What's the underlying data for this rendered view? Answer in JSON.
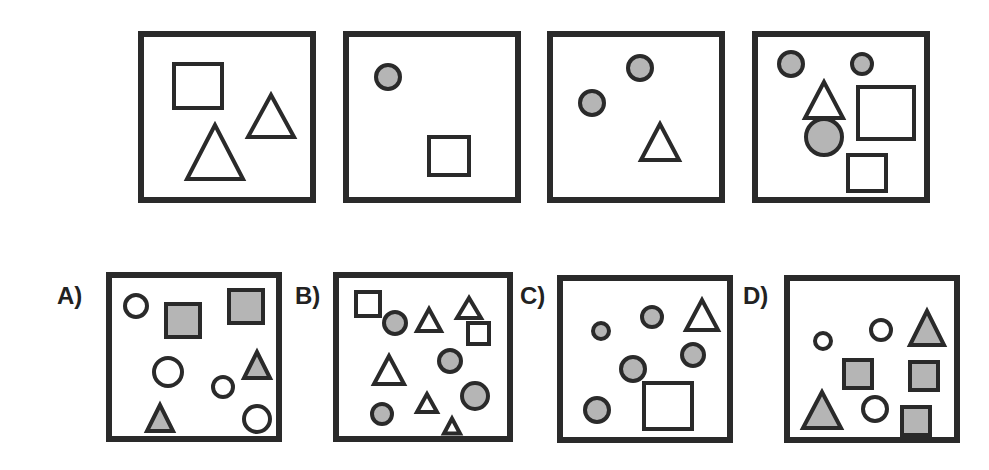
{
  "puzzle": {
    "colors": {
      "stroke": "#2a2a2a",
      "fill_gray": "#b5b5b5",
      "fill_white": "#ffffff"
    },
    "question_panels": [
      {
        "id": "q1",
        "box": [
          138,
          31,
          178,
          172
        ],
        "shapes": [
          {
            "type": "square",
            "x": 30,
            "y": 27,
            "w": 48,
            "h": 44,
            "fill": "white"
          },
          {
            "type": "triangle",
            "cx": 127,
            "cy": 79,
            "w": 46,
            "h": 42,
            "fill": "white"
          },
          {
            "type": "triangle",
            "cx": 71,
            "cy": 115,
            "w": 56,
            "h": 54,
            "fill": "white"
          }
        ]
      },
      {
        "id": "q2",
        "box": [
          343,
          31,
          178,
          172
        ],
        "shapes": [
          {
            "type": "circle",
            "cx": 39,
            "cy": 40,
            "r": 12,
            "fill": "gray"
          },
          {
            "type": "square",
            "x": 80,
            "y": 100,
            "w": 40,
            "h": 38,
            "fill": "white"
          }
        ]
      },
      {
        "id": "q3",
        "box": [
          547,
          31,
          178,
          172
        ],
        "shapes": [
          {
            "type": "circle",
            "cx": 39,
            "cy": 66,
            "r": 12,
            "fill": "gray"
          },
          {
            "type": "circle",
            "cx": 87,
            "cy": 31,
            "r": 12,
            "fill": "gray"
          },
          {
            "type": "triangle",
            "cx": 107,
            "cy": 105,
            "w": 38,
            "h": 36,
            "fill": "white"
          }
        ]
      },
      {
        "id": "q4",
        "box": [
          752,
          31,
          178,
          172
        ],
        "shapes": [
          {
            "type": "circle",
            "cx": 33,
            "cy": 27,
            "r": 12,
            "fill": "gray"
          },
          {
            "type": "circle",
            "cx": 104,
            "cy": 27,
            "r": 10,
            "fill": "gray"
          },
          {
            "type": "triangle",
            "cx": 66,
            "cy": 63,
            "w": 38,
            "h": 36,
            "fill": "white"
          },
          {
            "type": "square",
            "x": 100,
            "y": 50,
            "w": 56,
            "h": 52,
            "fill": "white"
          },
          {
            "type": "circle",
            "cx": 66,
            "cy": 100,
            "r": 18,
            "fill": "gray"
          },
          {
            "type": "square",
            "x": 90,
            "y": 118,
            "w": 38,
            "h": 36,
            "fill": "white"
          }
        ]
      }
    ],
    "options": [
      {
        "label": "A)",
        "label_pos": [
          57,
          282
        ],
        "box": [
          106,
          272,
          176,
          170
        ],
        "shapes": [
          {
            "type": "circle",
            "cx": 24,
            "cy": 28,
            "r": 11,
            "fill": "white"
          },
          {
            "type": "square",
            "x": 54,
            "y": 26,
            "w": 34,
            "h": 33,
            "fill": "gray"
          },
          {
            "type": "square",
            "x": 117,
            "y": 12,
            "w": 34,
            "h": 33,
            "fill": "gray"
          },
          {
            "type": "circle",
            "cx": 56,
            "cy": 94,
            "r": 14,
            "fill": "white"
          },
          {
            "type": "circle",
            "cx": 111,
            "cy": 109,
            "r": 10,
            "fill": "white"
          },
          {
            "type": "triangle",
            "cx": 145,
            "cy": 87,
            "w": 26,
            "h": 26,
            "fill": "gray"
          },
          {
            "type": "triangle",
            "cx": 48,
            "cy": 140,
            "w": 26,
            "h": 26,
            "fill": "gray"
          },
          {
            "type": "circle",
            "cx": 145,
            "cy": 141,
            "r": 13,
            "fill": "white"
          }
        ]
      },
      {
        "label": "B)",
        "label_pos": [
          295,
          282
        ],
        "box": [
          333,
          272,
          180,
          170
        ],
        "shapes": [
          {
            "type": "square",
            "x": 17,
            "y": 14,
            "w": 24,
            "h": 24,
            "fill": "white"
          },
          {
            "type": "circle",
            "cx": 56,
            "cy": 45,
            "r": 11,
            "fill": "gray"
          },
          {
            "type": "triangle",
            "cx": 90,
            "cy": 42,
            "w": 24,
            "h": 22,
            "fill": "white"
          },
          {
            "type": "triangle",
            "cx": 130,
            "cy": 30,
            "w": 24,
            "h": 20,
            "fill": "white"
          },
          {
            "type": "square",
            "x": 129,
            "y": 45,
            "w": 21,
            "h": 21,
            "fill": "white"
          },
          {
            "type": "triangle",
            "cx": 50,
            "cy": 92,
            "w": 30,
            "h": 28,
            "fill": "white"
          },
          {
            "type": "circle",
            "cx": 111,
            "cy": 83,
            "r": 11,
            "fill": "gray"
          },
          {
            "type": "circle",
            "cx": 136,
            "cy": 118,
            "r": 13,
            "fill": "gray"
          },
          {
            "type": "triangle",
            "cx": 88,
            "cy": 125,
            "w": 20,
            "h": 18,
            "fill": "white"
          },
          {
            "type": "circle",
            "cx": 43,
            "cy": 136,
            "r": 10,
            "fill": "gray"
          },
          {
            "type": "triangle",
            "cx": 113,
            "cy": 148,
            "w": 16,
            "h": 15,
            "fill": "white"
          }
        ]
      },
      {
        "label": "C)",
        "label_pos": [
          520,
          282
        ],
        "box": [
          557,
          275,
          176,
          168
        ],
        "shapes": [
          {
            "type": "circle",
            "cx": 38,
            "cy": 50,
            "r": 8,
            "fill": "gray"
          },
          {
            "type": "circle",
            "cx": 89,
            "cy": 36,
            "r": 10,
            "fill": "gray"
          },
          {
            "type": "triangle",
            "cx": 139,
            "cy": 34,
            "w": 32,
            "h": 30,
            "fill": "white"
          },
          {
            "type": "circle",
            "cx": 130,
            "cy": 74,
            "r": 11,
            "fill": "gray"
          },
          {
            "type": "circle",
            "cx": 70,
            "cy": 88,
            "r": 12,
            "fill": "gray"
          },
          {
            "type": "square",
            "x": 81,
            "y": 102,
            "w": 48,
            "h": 46,
            "fill": "white"
          },
          {
            "type": "circle",
            "cx": 34,
            "cy": 129,
            "r": 12,
            "fill": "gray"
          }
        ]
      },
      {
        "label": "D)",
        "label_pos": [
          743,
          282
        ],
        "box": [
          784,
          275,
          176,
          168
        ],
        "shapes": [
          {
            "type": "circle",
            "cx": 33,
            "cy": 60,
            "r": 8,
            "fill": "white"
          },
          {
            "type": "circle",
            "cx": 91,
            "cy": 49,
            "r": 10,
            "fill": "white"
          },
          {
            "type": "triangle",
            "cx": 137,
            "cy": 47,
            "w": 34,
            "h": 34,
            "fill": "gray"
          },
          {
            "type": "square",
            "x": 54,
            "y": 79,
            "w": 28,
            "h": 28,
            "fill": "gray"
          },
          {
            "type": "square",
            "x": 120,
            "y": 81,
            "w": 28,
            "h": 28,
            "fill": "gray"
          },
          {
            "type": "triangle",
            "cx": 32,
            "cy": 129,
            "w": 38,
            "h": 36,
            "fill": "gray"
          },
          {
            "type": "circle",
            "cx": 85,
            "cy": 128,
            "r": 12,
            "fill": "white"
          },
          {
            "type": "square",
            "x": 112,
            "y": 126,
            "w": 28,
            "h": 28,
            "fill": "gray"
          }
        ]
      }
    ]
  }
}
